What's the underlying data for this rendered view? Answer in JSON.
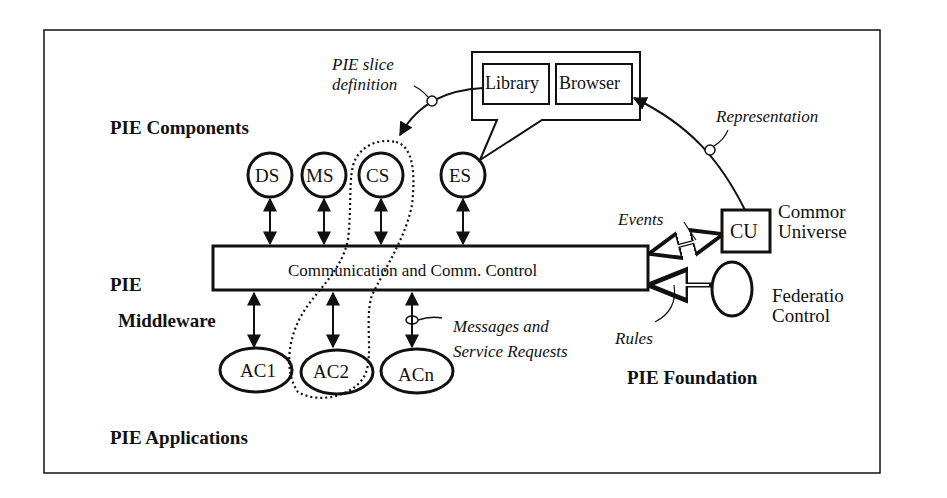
{
  "layers": {
    "components": "PIE Components",
    "middleware_line1": "PIE",
    "middleware_line2": "Middleware",
    "applications": "PIE Applications",
    "foundation": "PIE Foundation"
  },
  "components": [
    {
      "label": "DS"
    },
    {
      "label": "MS"
    },
    {
      "label": "CS"
    },
    {
      "label": "ES"
    }
  ],
  "middleware_bus": "Communication  and Comm. Control",
  "applications": [
    {
      "label": "AC1"
    },
    {
      "label": "AC2"
    },
    {
      "label": "ACn"
    }
  ],
  "library_browser": {
    "library": "Library",
    "browser": "Browser"
  },
  "common_universe": {
    "abbr": "CU",
    "line1": "Commor",
    "line2": "Universe"
  },
  "federation_control": {
    "line1": "Federatio",
    "line2": "Control"
  },
  "annotations": {
    "slice_line1": "PIE slice",
    "slice_line2": "definition",
    "representation": "Representation",
    "events": "Events",
    "rules": "Rules",
    "messages_line1": "Messages and",
    "messages_line2": "Service Requests"
  },
  "colors": {
    "stroke": "#111111",
    "background": "#ffffff"
  }
}
